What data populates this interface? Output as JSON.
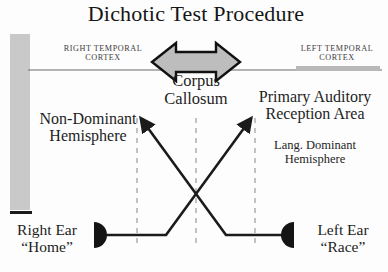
{
  "figure": {
    "title": "Dichotic Test Procedure",
    "width": 388,
    "height": 272
  },
  "labels": {
    "right_temporal_cortex_line1": "RIGHT TEMPORAL",
    "right_temporal_cortex_line2": "CORTEX",
    "left_temporal_cortex_line1": "LEFT TEMPORAL",
    "left_temporal_cortex_line2": "CORTEX",
    "corpus_callosum_line1": "Corpus",
    "corpus_callosum_line2": "Callosum",
    "non_dominant_line1": "Non-Dominant",
    "non_dominant_line2": "Hemisphere",
    "primary_auditory_line1": "Primary Auditory",
    "primary_auditory_line2": "Reception Area",
    "lang_dominant_line1": "Lang. Dominant",
    "lang_dominant_line2": "Hemisphere",
    "right_ear_line1": "Right Ear",
    "right_ear_line2": "“Home”",
    "left_ear_line1": "Left Ear",
    "left_ear_line2": "“Race”"
  },
  "colors": {
    "background": "#fdfdfd",
    "text": "#1d1d1d",
    "small_caps_text": "#3c3c3c",
    "gray_fill": "#c9c9c9",
    "gray_bar": "#c6c6c6",
    "arrow_fill": "#bdbdbd",
    "arrow_stroke": "#111111",
    "ear_fill": "#141414",
    "dashed_line": "#b4b4b4",
    "midline": "#6a6a6a",
    "pathway_stroke": "#1b1b1b"
  },
  "graphics": {
    "left_vertical_bar": {
      "name": "right-hemisphere-gray-bar",
      "x": 10,
      "y": 34,
      "width": 20,
      "height": 176
    },
    "left_bar_baseline": {
      "name": "right-hemisphere-baseline",
      "x": 10,
      "y": 211,
      "width": 22,
      "height": 3
    },
    "right_horizontal_bar": {
      "name": "left-temporal-gray-bar",
      "x": 296,
      "y": 66,
      "width": 84,
      "height": 5
    },
    "midline": {
      "name": "temporal-midline",
      "x1": 28,
      "y1": 70,
      "x2": 382,
      "y2": 70
    },
    "corpus_arrow": {
      "name": "corpus-callosum-double-arrow",
      "cx": 196,
      "cy": 62
    },
    "dashed_verticals": [
      {
        "name": "dashed-divider-left",
        "x": 137,
        "y1": 118,
        "y2": 246
      },
      {
        "name": "dashed-divider-center",
        "x": 196,
        "y1": 118,
        "y2": 246
      },
      {
        "name": "dashed-divider-right",
        "x": 255,
        "y1": 118,
        "y2": 246
      }
    ],
    "right_ear_marker": {
      "name": "right-ear-marker",
      "cx": 94,
      "cy": 235,
      "r": 13
    },
    "left_ear_marker": {
      "name": "left-ear-marker",
      "cx": 294,
      "cy": 235,
      "r": 13
    },
    "right_ear_pathway": {
      "name": "right-ear-crossed-pathway",
      "points": "94,235 166,235 249,122"
    },
    "left_ear_pathway": {
      "name": "left-ear-crossed-pathway",
      "points": "294,235 226,235 143,122"
    }
  }
}
